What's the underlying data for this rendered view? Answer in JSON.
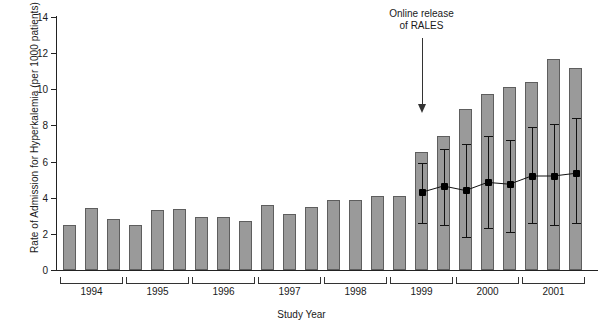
{
  "chart_data": {
    "type": "bar",
    "title": "",
    "xlabel": "Study Year",
    "ylabel": "Rate of Admission for Hyperkalemia (per 1000 patients)",
    "ylim": [
      0,
      14
    ],
    "yticks": [
      0,
      2,
      4,
      6,
      8,
      10,
      12,
      14
    ],
    "grid": false,
    "legend": "none",
    "categories": [
      "1994-1",
      "1994-2",
      "1994-3",
      "1995-1",
      "1995-2",
      "1995-3",
      "1996-1",
      "1996-2",
      "1996-3",
      "1997-1",
      "1997-2",
      "1997-3",
      "1998-1",
      "1998-2",
      "1998-3",
      "1999-1",
      "1999-2",
      "1999-3",
      "2000-1",
      "2000-2",
      "2000-3",
      "2001-1",
      "2001-2",
      "2001-3"
    ],
    "values": [
      2.5,
      3.45,
      2.85,
      2.5,
      3.3,
      3.4,
      2.95,
      2.95,
      2.7,
      3.6,
      3.1,
      3.5,
      3.85,
      3.85,
      4.1,
      4.1,
      6.55,
      7.4,
      8.9,
      9.75,
      10.1,
      10.4,
      11.7,
      11.2
    ],
    "year_groups": [
      {
        "label": "1994",
        "count": 3
      },
      {
        "label": "1995",
        "count": 3
      },
      {
        "label": "1996",
        "count": 3
      },
      {
        "label": "1997",
        "count": 3
      },
      {
        "label": "1998",
        "count": 3
      },
      {
        "label": "1999",
        "count": 3
      },
      {
        "label": "2000",
        "count": 3
      },
      {
        "label": "2001",
        "count": 3
      }
    ],
    "series": [
      {
        "name": "bars",
        "type": "bar",
        "values": [
          2.5,
          3.45,
          2.85,
          2.5,
          3.3,
          3.4,
          2.95,
          2.95,
          2.7,
          3.6,
          3.1,
          3.5,
          3.85,
          3.85,
          4.1,
          4.1,
          6.55,
          7.4,
          8.9,
          9.75,
          10.1,
          10.4,
          11.7,
          11.2
        ]
      },
      {
        "name": "line-with-error-bars",
        "type": "line",
        "start_index": 16,
        "points": [
          {
            "index": 16,
            "value": 4.3,
            "low": 2.6,
            "high": 5.9
          },
          {
            "index": 17,
            "value": 4.65,
            "low": 2.5,
            "high": 6.7
          },
          {
            "index": 18,
            "value": 4.4,
            "low": 1.8,
            "high": 7.0
          },
          {
            "index": 19,
            "value": 4.85,
            "low": 2.3,
            "high": 7.4
          },
          {
            "index": 20,
            "value": 4.75,
            "low": 2.1,
            "high": 7.2
          },
          {
            "index": 21,
            "value": 5.2,
            "low": 2.6,
            "high": 7.9
          },
          {
            "index": 22,
            "value": 5.2,
            "low": 2.5,
            "high": 8.1
          },
          {
            "index": 23,
            "value": 5.35,
            "low": 2.6,
            "high": 8.4
          }
        ]
      }
    ],
    "annotations": [
      {
        "name": "online-release-of-rales",
        "line1": "Online release",
        "line2": "of RALES",
        "arrow": "down",
        "points_to_index": 16
      }
    ],
    "colors": {
      "bar_fill": "#9a9a9a",
      "bar_edge": "#5e5e5e",
      "line": "#111111",
      "marker": "#000000",
      "axis": "#222222",
      "background": "#ffffff"
    }
  }
}
